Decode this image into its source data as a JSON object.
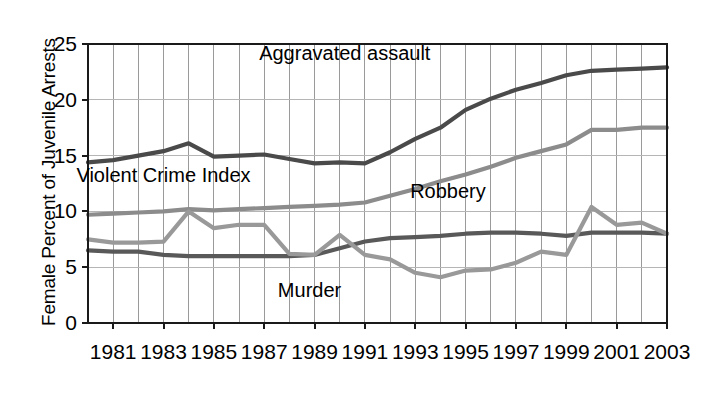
{
  "chart_data": {
    "type": "line",
    "title": "",
    "xlabel": "",
    "ylabel": "Female Percent of Juvenile Arrests",
    "xlim": [
      1980,
      2003
    ],
    "ylim": [
      0,
      25
    ],
    "grid": true,
    "legend_position": "inline-labels",
    "yticks": [
      "0",
      "5",
      "10",
      "15",
      "20",
      "25"
    ],
    "ytick_values": [
      0,
      5,
      10,
      15,
      20,
      25
    ],
    "xticks": [
      "1981",
      "1983",
      "1985",
      "1987",
      "1989",
      "1991",
      "1993",
      "1995",
      "1997",
      "1999",
      "2001",
      "2003"
    ],
    "xtick_values": [
      1981,
      1983,
      1985,
      1987,
      1989,
      1991,
      1993,
      1995,
      1997,
      1999,
      2001,
      2003
    ],
    "x": [
      1980,
      1981,
      1982,
      1983,
      1984,
      1985,
      1986,
      1987,
      1988,
      1989,
      1990,
      1991,
      1992,
      1993,
      1994,
      1995,
      1996,
      1997,
      1998,
      1999,
      2000,
      2001,
      2002,
      2003
    ],
    "series": [
      {
        "name": "Aggravated assault",
        "color": "#4a4a4a",
        "label_x": 1990.2,
        "label_y": 23.6,
        "values": [
          14.4,
          14.6,
          15.0,
          15.4,
          16.1,
          14.9,
          15.0,
          15.1,
          14.7,
          14.3,
          14.4,
          14.3,
          15.3,
          16.5,
          17.5,
          19.1,
          20.1,
          20.9,
          21.5,
          22.2,
          22.6,
          22.7,
          22.8,
          22.9
        ]
      },
      {
        "name": "Violent Crime Index",
        "color": "#8c8c8c",
        "label_x": 1983.0,
        "label_y": 12.6,
        "values": [
          9.7,
          9.8,
          9.9,
          10.0,
          10.2,
          10.1,
          10.2,
          10.3,
          10.4,
          10.5,
          10.6,
          10.8,
          11.4,
          12.0,
          12.7,
          13.3,
          14.0,
          14.8,
          15.4,
          16.0,
          17.3,
          17.3,
          17.5,
          17.5
        ]
      },
      {
        "name": "Robbery",
        "color": "#595959",
        "label_x": 1994.3,
        "label_y": 11.2,
        "values": [
          6.5,
          6.4,
          6.4,
          6.1,
          6.0,
          6.0,
          6.0,
          6.0,
          6.0,
          6.1,
          6.7,
          7.3,
          7.6,
          7.7,
          7.8,
          8.0,
          8.1,
          8.1,
          8.0,
          7.8,
          8.1,
          8.1,
          8.1,
          8.0
        ]
      },
      {
        "name": "Murder",
        "color": "#999999",
        "label_x": 1988.8,
        "label_y": 2.3,
        "values": [
          7.5,
          7.2,
          7.2,
          7.3,
          10.0,
          8.5,
          8.8,
          8.8,
          6.2,
          6.1,
          7.9,
          6.1,
          5.7,
          4.5,
          4.1,
          4.7,
          4.8,
          5.4,
          6.4,
          6.1,
          10.4,
          8.8,
          9.0,
          8.0
        ]
      }
    ]
  },
  "layout": {
    "plot_left": 88,
    "plot_right": 667,
    "plot_top": 44,
    "plot_bottom": 323
  }
}
